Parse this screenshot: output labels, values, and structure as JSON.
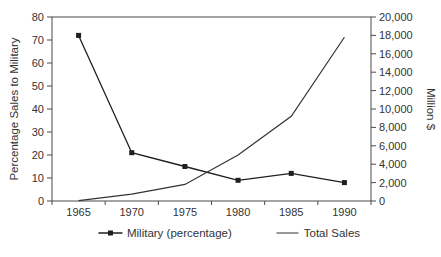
{
  "chart_data": {
    "type": "line",
    "title": "",
    "xlabel": "",
    "categories": [
      "1965",
      "1970",
      "1975",
      "1980",
      "1985",
      "1990"
    ],
    "series": [
      {
        "name": "Military (percentage)",
        "axis": "left",
        "values": [
          72,
          21,
          15,
          9,
          12,
          8
        ],
        "marker": "square",
        "color": "#1f1f1f"
      },
      {
        "name": "Total Sales",
        "axis": "right",
        "values": [
          50,
          750,
          1800,
          5000,
          9200,
          17800
        ],
        "marker": "none",
        "color": "#333333"
      }
    ],
    "axes": {
      "left": {
        "title": "Percentage Sales to Military",
        "min": 0,
        "max": 80,
        "tick_values": [
          0,
          10,
          20,
          30,
          40,
          50,
          60,
          70,
          80
        ],
        "tick_labels": [
          "0",
          "10",
          "20",
          "30",
          "40",
          "50",
          "60",
          "70",
          "80"
        ]
      },
      "right": {
        "title": "Million $",
        "min": 0,
        "max": 20000,
        "tick_values": [
          0,
          2000,
          4000,
          6000,
          8000,
          10000,
          12000,
          14000,
          16000,
          18000,
          20000
        ],
        "tick_labels": [
          "0",
          "2,000",
          "4,000",
          "6,000",
          "8,000",
          "10,000",
          "12,000",
          "14,000",
          "16,000",
          "18,000",
          "20,000"
        ]
      }
    },
    "grid": false,
    "legend_position": "bottom",
    "frame_color": "#4a4a4a",
    "text_color": "#333333"
  }
}
